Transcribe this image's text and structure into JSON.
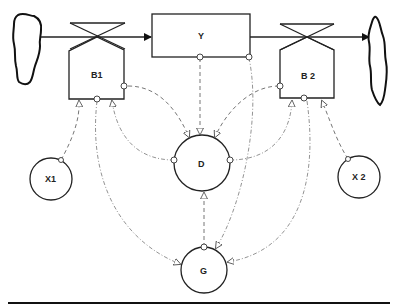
{
  "diagram": {
    "type": "stock-and-flow (system dynamics)",
    "nodes": {
      "stock": {
        "label": "Y"
      },
      "rate1": {
        "label": "B1"
      },
      "rate2": {
        "label": "B 2"
      },
      "aux_d": {
        "label": "D"
      },
      "aux_x1": {
        "label": "X1"
      },
      "aux_x2": {
        "label": "X 2"
      },
      "aux_g": {
        "label": "G"
      },
      "source_cloud": {
        "label": ""
      },
      "sink_cloud": {
        "label": ""
      }
    },
    "flows": [
      {
        "from": "source_cloud",
        "via": "B1",
        "to": "Y"
      },
      {
        "from": "Y",
        "via": "B 2",
        "to": "sink_cloud"
      }
    ],
    "information_links": [
      {
        "from": "B1",
        "to": "D"
      },
      {
        "from": "B1",
        "to": "G"
      },
      {
        "from": "X1",
        "to": "B1"
      },
      {
        "from": "D",
        "to": "B1"
      },
      {
        "from": "Y",
        "to": "D"
      },
      {
        "from": "Y",
        "to": "G"
      },
      {
        "from": "B 2",
        "to": "D"
      },
      {
        "from": "B 2",
        "to": "G"
      },
      {
        "from": "X 2",
        "to": "B 2"
      },
      {
        "from": "D",
        "to": "B 2"
      },
      {
        "from": "G",
        "to": "D"
      }
    ]
  },
  "colors": {
    "line": "#222222",
    "link": "#666666",
    "background": "#ffffff"
  }
}
